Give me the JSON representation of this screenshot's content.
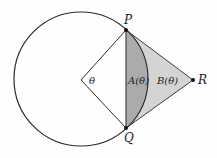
{
  "diagram": {
    "type": "geometry",
    "circle": {
      "cx": 81,
      "cy": 79,
      "r": 67
    },
    "points": {
      "P": {
        "label": "P",
        "x": 126,
        "y": 30
      },
      "Q": {
        "label": "Q",
        "x": 126,
        "y": 128
      },
      "R": {
        "label": "R",
        "x": 193,
        "y": 80
      },
      "O": {
        "x": 81,
        "y": 80
      }
    },
    "labels": {
      "theta": "θ",
      "A": "A(θ)",
      "B": "B(θ)",
      "P": "P",
      "Q": "Q",
      "R": "R"
    },
    "colors": {
      "stroke": "#2a2a2a",
      "region_A": "#ababab",
      "region_B": "#d4d4d4"
    }
  }
}
